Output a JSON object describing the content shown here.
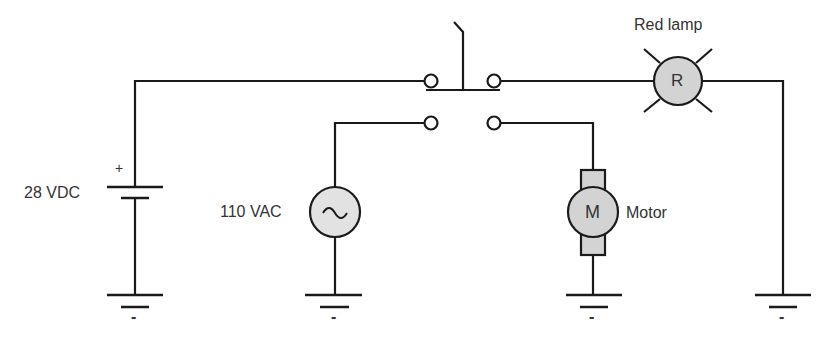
{
  "diagram": {
    "type": "electrical-schematic",
    "components": {
      "battery": {
        "label": "28 VDC",
        "polarity_plus": "+",
        "polarity_minus": "-"
      },
      "ac_source": {
        "label": "110 VAC",
        "symbol": "~"
      },
      "switch": {
        "type": "double-pole pushbutton"
      },
      "lamp": {
        "label": "Red lamp",
        "symbol": "R"
      },
      "motor": {
        "label": "Motor",
        "symbol": "M"
      }
    },
    "ground_minus": "-",
    "colors": {
      "wire": "#1a1a1a",
      "component_fill": "#d3d3d3",
      "text": "#333333"
    }
  }
}
